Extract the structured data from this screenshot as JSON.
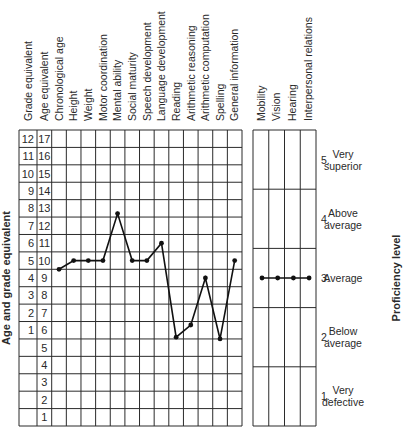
{
  "chart_data": {
    "type": "line",
    "title": "",
    "ylabel": "Age and grade equivalent",
    "ylabel_right": "Proficiency level",
    "grade_equivalent_ticks": [
      "12",
      "11",
      "10",
      "9",
      "8",
      "7",
      "6",
      "5",
      "4",
      "3",
      "2",
      "1",
      "",
      "",
      "",
      "",
      ""
    ],
    "age_equivalent_ticks": [
      "17",
      "16",
      "15",
      "14",
      "13",
      "12",
      "11",
      "10",
      "9",
      "8",
      "7",
      "6",
      "5",
      "4",
      "3",
      "2",
      "1"
    ],
    "columns_header": [
      "Grade equivalent",
      "Age equivalent"
    ],
    "categories": [
      "Chronological age",
      "Height",
      "Weight",
      "Motor coordination",
      "Mental ability",
      "Social maturity",
      "Speech development",
      "Language development",
      "Reading",
      "Arithmetic reasoning",
      "Arithmetic computation",
      "Spelling",
      "General information"
    ],
    "series": [
      {
        "name": "Age equivalent",
        "values": [
          9.5,
          10,
          10,
          10,
          12.7,
          10,
          10,
          11,
          5.6,
          6.3,
          9,
          5.5,
          10
        ]
      }
    ],
    "ylim": [
      0,
      17
    ],
    "grid": true,
    "proficiency": {
      "categories": [
        "Mobility",
        "Vision",
        "Hearing",
        "Interpersonal relations"
      ],
      "values": [
        3,
        3,
        3,
        3
      ],
      "levels": [
        {
          "num": "5.",
          "line1": "Very",
          "line2": "superior"
        },
        {
          "num": "4.",
          "line1": "Above",
          "line2": "average"
        },
        {
          "num": "3.",
          "line1": "Average",
          "line2": ""
        },
        {
          "num": "2.",
          "line1": "Below",
          "line2": "average"
        },
        {
          "num": "1.",
          "line1": "Very",
          "line2": "defective"
        }
      ],
      "ylim": [
        0.5,
        5.5
      ]
    }
  },
  "colors": {
    "ink": "#111111",
    "grid": "#2b2b2b",
    "background": "#ffffff"
  }
}
